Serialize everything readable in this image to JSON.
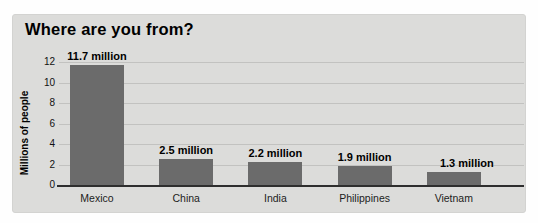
{
  "chart_data": {
    "type": "bar",
    "title": "Where are you from?",
    "ylabel": "Millions of people",
    "xlabel": "",
    "categories": [
      "Mexico",
      "China",
      "India",
      "Philippines",
      "Vietnam"
    ],
    "values": [
      11.7,
      2.5,
      2.2,
      1.9,
      1.3
    ],
    "value_labels": [
      "11.7 million",
      "2.5 million",
      "2.2 million",
      "1.9 million",
      "1.3 million"
    ],
    "yticks": [
      0,
      2,
      4,
      6,
      8,
      10,
      12
    ],
    "ylim": [
      0,
      12
    ],
    "grid": true,
    "legend": "none",
    "colors": {
      "bar": "#6b6b6b",
      "panel_bg": "#dcdcda",
      "gridline": "#c2c2c0",
      "axis_line": "#2e2e2e",
      "text": "#000000"
    }
  }
}
